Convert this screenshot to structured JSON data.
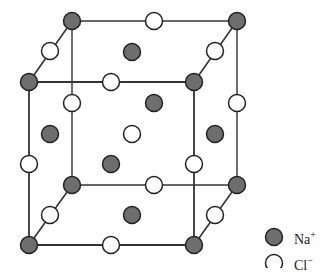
{
  "diagram": {
    "colors": {
      "na": "#6e6e6e",
      "cl": "#ffffff",
      "stroke": "#222222",
      "line": "#333333"
    },
    "cube": {
      "back": [
        [
          72,
          21
        ],
        [
          237,
          21
        ],
        [
          237,
          185
        ],
        [
          72,
          185
        ]
      ],
      "front": [
        [
          29,
          82
        ],
        [
          194,
          82
        ],
        [
          194,
          245
        ],
        [
          29,
          245
        ]
      ]
    },
    "atoms": [
      {
        "x": 72,
        "y": 21,
        "type": "na"
      },
      {
        "x": 237,
        "y": 21,
        "type": "na"
      },
      {
        "x": 72,
        "y": 185,
        "type": "na"
      },
      {
        "x": 237,
        "y": 185,
        "type": "na"
      },
      {
        "x": 29,
        "y": 82,
        "type": "na"
      },
      {
        "x": 194,
        "y": 82,
        "type": "na"
      },
      {
        "x": 29,
        "y": 245,
        "type": "na"
      },
      {
        "x": 194,
        "y": 245,
        "type": "na"
      },
      {
        "x": 154,
        "y": 21,
        "type": "cl"
      },
      {
        "x": 154,
        "y": 185,
        "type": "cl"
      },
      {
        "x": 72,
        "y": 103,
        "type": "cl"
      },
      {
        "x": 237,
        "y": 103,
        "type": "cl"
      },
      {
        "x": 111,
        "y": 82,
        "type": "cl"
      },
      {
        "x": 111,
        "y": 245,
        "type": "cl"
      },
      {
        "x": 29,
        "y": 164,
        "type": "cl"
      },
      {
        "x": 194,
        "y": 164,
        "type": "cl"
      },
      {
        "x": 50,
        "y": 51,
        "type": "cl"
      },
      {
        "x": 215,
        "y": 51,
        "type": "cl"
      },
      {
        "x": 50,
        "y": 215,
        "type": "cl"
      },
      {
        "x": 215,
        "y": 215,
        "type": "cl"
      },
      {
        "x": 132,
        "y": 52,
        "type": "na"
      },
      {
        "x": 132,
        "y": 215,
        "type": "na"
      },
      {
        "x": 50,
        "y": 134,
        "type": "na"
      },
      {
        "x": 215,
        "y": 134,
        "type": "na"
      },
      {
        "x": 154,
        "y": 103,
        "type": "na"
      },
      {
        "x": 111,
        "y": 164,
        "type": "na"
      },
      {
        "x": 132,
        "y": 134,
        "type": "cl"
      }
    ]
  },
  "legend": {
    "items": [
      {
        "label": "Na",
        "charge": "+",
        "type": "na"
      },
      {
        "label": "Cl",
        "charge": "−",
        "type": "cl"
      }
    ]
  }
}
